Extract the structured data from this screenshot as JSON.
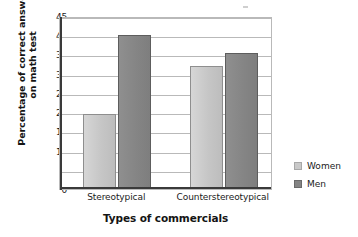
{
  "chart_data": {
    "type": "bar",
    "title": "",
    "xlabel": "Types of commercials",
    "ylabel_line1": "Percentage of correct answers",
    "ylabel_line2": "on math test",
    "categories": [
      "Stereotypical",
      "Counterstereotypical"
    ],
    "series": [
      {
        "name": "Women",
        "values": [
          19.5,
          32
        ],
        "color": "#c9c9c9"
      },
      {
        "name": "Men",
        "values": [
          40,
          35.3
        ],
        "color": "#848484"
      }
    ],
    "ylim": [
      0,
      45
    ],
    "ytick_values": [
      0,
      5,
      10,
      15,
      20,
      25,
      30,
      35,
      40,
      45
    ],
    "ytick_labels": [
      "0",
      "5",
      "10",
      "15",
      "20",
      "25",
      "30",
      "35",
      "40",
      "45"
    ],
    "grid": "horizontal",
    "legend_position": "right",
    "legend": [
      {
        "label": "Women",
        "color": "#c9c9c9"
      },
      {
        "label": "Men",
        "color": "#848484"
      }
    ]
  }
}
